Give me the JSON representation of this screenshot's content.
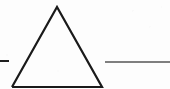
{
  "canvas": {
    "width": 170,
    "height": 89,
    "background_color": "#fdfdfd",
    "description": "Line drawing of an open triangle flanked by two horizontal rules"
  },
  "figure": {
    "type": "line-drawing",
    "stroke_color_dark": "#1a1a1a",
    "stroke_color_light": "#555555",
    "shapes": [
      {
        "name": "triangle",
        "kind": "polyline",
        "closed": false,
        "stroke": "#1a1a1a",
        "stroke_width": 2.2,
        "points": [
          {
            "x": 12,
            "y": 87
          },
          {
            "x": 57,
            "y": 7
          },
          {
            "x": 102,
            "y": 87
          },
          {
            "x": 12,
            "y": 87
          }
        ],
        "apex": {
          "x": 57,
          "y": 7
        },
        "base_left": {
          "x": 12,
          "y": 87
        },
        "base_right": {
          "x": 102,
          "y": 87
        }
      },
      {
        "name": "left-dash",
        "kind": "line",
        "stroke": "#1f1f1f",
        "stroke_width": 2.0,
        "x1": 0,
        "y1": 61,
        "x2": 9,
        "y2": 61
      },
      {
        "name": "right-rule",
        "kind": "line",
        "stroke": "#555555",
        "stroke_width": 1.3,
        "x1": 105,
        "y1": 62,
        "x2": 170,
        "y2": 62
      }
    ]
  }
}
